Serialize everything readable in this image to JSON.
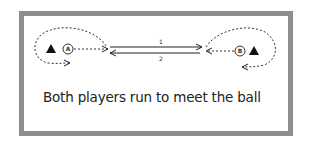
{
  "diagram": {
    "caption": "Both players run to meet the ball",
    "players": [
      {
        "label": "A",
        "side": "left"
      },
      {
        "label": "B",
        "side": "right"
      }
    ],
    "passes": [
      {
        "label": "1",
        "direction": "left-to-right"
      },
      {
        "label": "2",
        "direction": "right-to-left"
      }
    ],
    "markers": [
      "cone-left",
      "cone-right"
    ],
    "colors": {
      "frame": "#8e8e8e",
      "ink": "#222222"
    }
  }
}
